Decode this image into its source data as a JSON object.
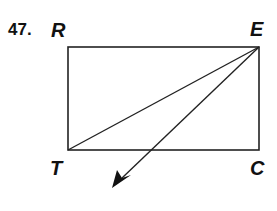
{
  "problem_number": "47.",
  "vertices": {
    "R": {
      "label": "R",
      "x": 68,
      "y": 47
    },
    "E": {
      "label": "E",
      "x": 259,
      "y": 47
    },
    "T": {
      "label": "T",
      "x": 68,
      "y": 150
    },
    "C": {
      "label": "C",
      "x": 259,
      "y": 150
    }
  },
  "segments": [
    "RE",
    "EC",
    "CT",
    "TR",
    "TE"
  ],
  "ray": {
    "from": "E",
    "direction": "down-left",
    "tip": {
      "x": 112,
      "y": 188
    }
  },
  "colors": {
    "line": "#222222",
    "text": "#111111",
    "background": "#ffffff"
  }
}
